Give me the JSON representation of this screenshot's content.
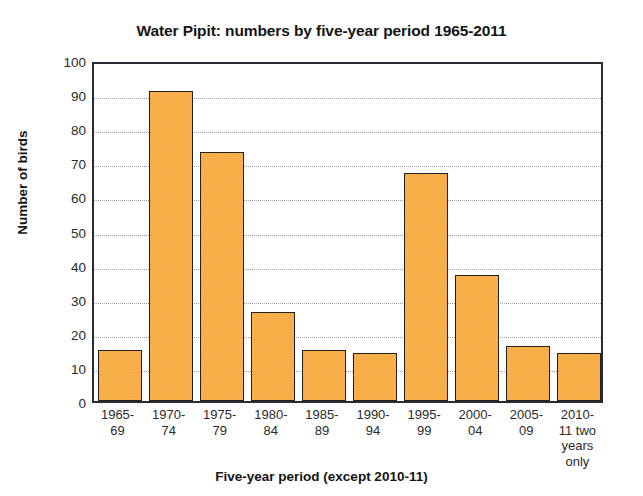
{
  "chart_data": {
    "type": "bar",
    "title": "Water Pipit: numbers by five-year period 1965-2011",
    "xlabel": "Five-year period (except 2010-11)",
    "ylabel": "Number of birds",
    "categories": [
      "1965-69",
      "1970-74",
      "1975-79",
      "1980-84",
      "1985-89",
      "1990-94",
      "1995-99",
      "2000-04",
      "2005-09",
      "2010-11 two years only"
    ],
    "category_lines": [
      [
        "1965-",
        "69"
      ],
      [
        "1970-",
        "74"
      ],
      [
        "1975-",
        "79"
      ],
      [
        "1980-",
        "84"
      ],
      [
        "1985-",
        "89"
      ],
      [
        "1990-",
        "94"
      ],
      [
        "1995-",
        "99"
      ],
      [
        "2000-",
        "04"
      ],
      [
        "2005-",
        "09"
      ],
      [
        "2010-",
        "11 two",
        "years",
        "only"
      ]
    ],
    "values": [
      15,
      91,
      73,
      26,
      15,
      14,
      67,
      37,
      16,
      14
    ],
    "ylim": [
      0,
      100
    ],
    "ytick_step": 10,
    "yticks": [
      0,
      10,
      20,
      30,
      40,
      50,
      60,
      70,
      80,
      90,
      100
    ],
    "ytick_labels": [
      "0",
      "10",
      "20",
      "30",
      "40",
      "50",
      "60",
      "70",
      "80",
      "90",
      "100"
    ],
    "grid": "horizontal-dotted",
    "legend": "none",
    "bar_color": "#f7a12a",
    "bar_edge_color": "#231f20",
    "gridline_color": "#9a9aa0",
    "axis_color": "#2b2b33",
    "background_color": "#ffffff"
  }
}
